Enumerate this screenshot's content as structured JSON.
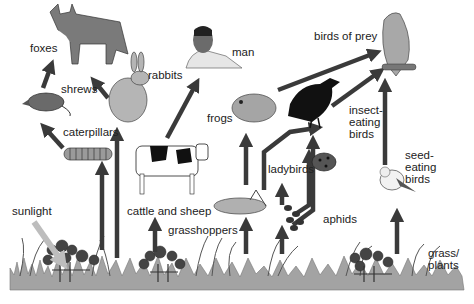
{
  "diagram": {
    "type": "food web",
    "colors": {
      "arrow": "#3a3a3a",
      "sunlight_arrow": "#bdbdbd",
      "grass": "#9a9a9a",
      "animal": "#8c8c8c",
      "dark": "#1a1a1a"
    },
    "nodes": {
      "foxes": "foxes",
      "shrews": "shrews",
      "rabbits": "rabbits",
      "man": "man",
      "birds_of_prey": "birds of prey",
      "caterpillars": "caterpillars",
      "frogs": "frogs",
      "insect_eating_birds": "insect-\neating\nbirds",
      "cattle_and_sheep": "cattle and sheep",
      "ladybirds": "ladybirds",
      "seed_eating_birds": "seed-\neating\nbirds",
      "sunlight": "sunlight",
      "grasshoppers": "grasshoppers",
      "aphids": "aphids",
      "grass_plants": "grass/\nplants"
    },
    "edges": [
      [
        "sunlight",
        "grass/plants"
      ],
      [
        "grass/plants",
        "caterpillars"
      ],
      [
        "grass/plants",
        "rabbits"
      ],
      [
        "grass/plants",
        "cattle and sheep"
      ],
      [
        "grass/plants",
        "grasshoppers"
      ],
      [
        "grass/plants",
        "aphids"
      ],
      [
        "grass/plants",
        "seed-eating birds"
      ],
      [
        "caterpillars",
        "shrews"
      ],
      [
        "shrews",
        "foxes"
      ],
      [
        "rabbits",
        "foxes"
      ],
      [
        "cattle and sheep",
        "man"
      ],
      [
        "grasshoppers",
        "frogs"
      ],
      [
        "grasshoppers",
        "insect-eating birds"
      ],
      [
        "frogs",
        "birds of prey"
      ],
      [
        "aphids",
        "ladybirds"
      ],
      [
        "aphids",
        "insect-eating birds"
      ],
      [
        "ladybirds",
        "insect-eating birds"
      ],
      [
        "insect-eating birds",
        "birds of prey"
      ],
      [
        "seed-eating birds",
        "birds of prey"
      ]
    ]
  }
}
